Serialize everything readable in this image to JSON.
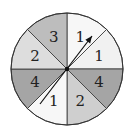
{
  "spinner": {
    "center": [
      67,
      69
    ],
    "radius": 56,
    "sectors": [
      {
        "label": "1",
        "color": "#f7f7f7",
        "start": 90,
        "end": 45
      },
      {
        "label": "1",
        "color": "#f1f1f1",
        "start": 45,
        "end": 0
      },
      {
        "label": "4",
        "color": "#a5a5a5",
        "start": 0,
        "end": -45
      },
      {
        "label": "2",
        "color": "#cfcfcf",
        "start": -45,
        "end": -90
      },
      {
        "label": "1",
        "color": "#f7f7f7",
        "start": -90,
        "end": -135
      },
      {
        "label": "4",
        "color": "#a5a5a5",
        "start": -135,
        "end": -180
      },
      {
        "label": "2",
        "color": "#dddddd",
        "start": 180,
        "end": 135
      },
      {
        "label": "3",
        "color": "#bdbdbd",
        "start": 135,
        "end": 90
      }
    ],
    "pointer": {
      "from": [
        40,
        104
      ],
      "to": [
        92,
        36
      ]
    }
  }
}
